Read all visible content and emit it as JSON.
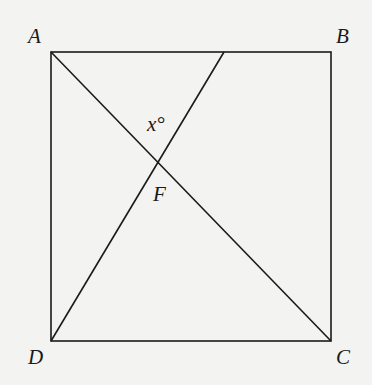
{
  "diagram": {
    "type": "geometry",
    "shape": "square",
    "vertices": {
      "A": {
        "label": "A",
        "x": 51,
        "y": 52
      },
      "B": {
        "label": "B",
        "x": 331,
        "y": 52
      },
      "C": {
        "label": "C",
        "x": 331,
        "y": 341
      },
      "D": {
        "label": "D",
        "x": 51,
        "y": 341
      }
    },
    "segments": [
      {
        "name": "AB",
        "from": [
          51,
          52
        ],
        "to": [
          331,
          52
        ]
      },
      {
        "name": "BC",
        "from": [
          331,
          52
        ],
        "to": [
          331,
          341
        ]
      },
      {
        "name": "CD",
        "from": [
          331,
          341
        ],
        "to": [
          51,
          341
        ]
      },
      {
        "name": "DA",
        "from": [
          51,
          341
        ],
        "to": [
          51,
          52
        ]
      },
      {
        "name": "AC",
        "from": [
          51,
          52
        ],
        "to": [
          331,
          341
        ]
      },
      {
        "name": "D-to-AB",
        "from": [
          51,
          341
        ],
        "to": [
          224,
          52
        ]
      }
    ],
    "intersection": {
      "label": "F",
      "x": 159,
      "y": 161
    },
    "angle_label": "x°",
    "stroke_color": "#1a1a1a",
    "background_color": "#f3f3f1"
  }
}
